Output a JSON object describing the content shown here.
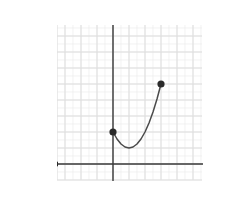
{
  "exercise": {
    "number_label": "19."
  },
  "axes": {
    "x_axis_name": "x",
    "y_axis_name": "y",
    "x_tick_labels": [
      "-4",
      "-2",
      "0",
      "2",
      "4",
      "6"
    ],
    "y_tick_labels": [
      "0",
      "2",
      "4",
      "6",
      "8"
    ],
    "colors": {
      "axis": "#3a3a3a",
      "grid_minor": "#ebebeb",
      "grid_major": "#dcdcdc",
      "curve": "#4a4a4a",
      "point": "#2b2b2b",
      "text": "#1a1a1a"
    }
  },
  "chart_data": {
    "type": "line",
    "title": "",
    "xlabel": "x",
    "ylabel": "y",
    "xlim": [
      -5,
      6.5
    ],
    "ylim": [
      -1,
      9
    ],
    "xticks": [
      -4,
      -2,
      0,
      2,
      4,
      6
    ],
    "yticks": [
      0,
      2,
      4,
      6,
      8
    ],
    "grid": true,
    "grid_minor_step": 0.5,
    "grid_major_step": 1,
    "legend": "none",
    "series": [
      {
        "name": "curve",
        "kind": "parabola-arc",
        "domain": [
          0,
          3
        ],
        "vertex": [
          1,
          1
        ],
        "points": [
          [
            0,
            2
          ],
          [
            0.25,
            1.5625
          ],
          [
            0.5,
            1.25
          ],
          [
            0.75,
            1.0625
          ],
          [
            1,
            1
          ],
          [
            1.25,
            1.0625
          ],
          [
            1.5,
            1.25
          ],
          [
            1.75,
            1.5625
          ],
          [
            2,
            2
          ],
          [
            2.25,
            2.5625
          ],
          [
            2.5,
            3.25
          ],
          [
            2.75,
            4.0625
          ],
          [
            3,
            5
          ]
        ],
        "endpoints": [
          {
            "x": 0,
            "y": 2,
            "style": "closed"
          },
          {
            "x": 3,
            "y": 5,
            "style": "closed"
          }
        ]
      }
    ]
  }
}
